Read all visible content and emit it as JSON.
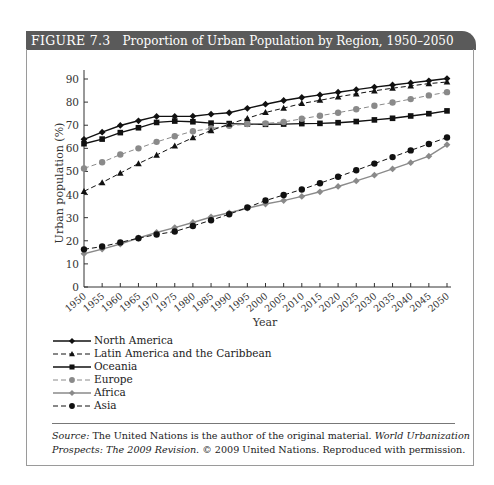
{
  "figure": {
    "number": "FIGURE 7.3",
    "title": "Proportion of Urban Population by Region, 1950–2050"
  },
  "colors": {
    "title_bar": "#5a5a5a",
    "black": "#111111",
    "gray": "#8a8a8a"
  },
  "source": {
    "label": "Source:",
    "text1": " The United Nations is the author of the original material. ",
    "work": "World Urbanization Prospects: The 2009 Revision.",
    "text2": " © 2009 United Nations. Reproduced with permission."
  },
  "chart_data": {
    "type": "line",
    "title": "Proportion of Urban Population by Region, 1950–2050",
    "xlabel": "Year",
    "ylabel": "Urban population (%)",
    "ylim": [
      0,
      90
    ],
    "yticks": [
      0,
      10,
      20,
      30,
      40,
      50,
      60,
      70,
      80,
      90
    ],
    "grid": false,
    "legend_position": "below",
    "x": [
      1950,
      1955,
      1960,
      1965,
      1970,
      1975,
      1980,
      1985,
      1990,
      1995,
      2000,
      2005,
      2010,
      2015,
      2020,
      2025,
      2030,
      2035,
      2040,
      2045,
      2050
    ],
    "series": [
      {
        "name": "North America",
        "marker": "diamond",
        "line": "solid",
        "color": "#111111",
        "values": [
          63.9,
          67.0,
          69.9,
          71.9,
          73.8,
          73.8,
          73.9,
          74.8,
          75.4,
          77.3,
          79.1,
          80.7,
          82.0,
          83.1,
          84.3,
          85.4,
          86.5,
          87.4,
          88.3,
          89.2,
          90.2
        ]
      },
      {
        "name": "Latin America and the Caribbean",
        "marker": "triangle",
        "line": "dashed",
        "color": "#111111",
        "values": [
          41.4,
          45.2,
          49.3,
          53.4,
          57.1,
          61.0,
          64.6,
          67.7,
          70.5,
          73.0,
          75.5,
          77.4,
          79.4,
          80.8,
          82.3,
          83.6,
          84.9,
          86.0,
          87.0,
          88.0,
          88.7
        ]
      },
      {
        "name": "Oceania",
        "marker": "square",
        "line": "solid",
        "color": "#111111",
        "values": [
          62.0,
          64.0,
          66.8,
          68.9,
          71.2,
          71.8,
          71.5,
          70.9,
          70.7,
          70.5,
          70.4,
          70.5,
          70.7,
          70.8,
          71.1,
          71.6,
          72.3,
          73.0,
          74.0,
          75.0,
          76.2
        ]
      },
      {
        "name": "Europe",
        "marker": "circle",
        "line": "dashed",
        "color": "#8a8a8a",
        "values": [
          51.3,
          54.0,
          57.3,
          60.0,
          62.8,
          65.2,
          67.4,
          68.6,
          69.8,
          70.5,
          70.8,
          71.4,
          72.8,
          74.1,
          75.4,
          76.9,
          78.4,
          79.8,
          81.3,
          82.9,
          84.3
        ]
      },
      {
        "name": "Africa",
        "marker": "diamond",
        "line": "solid",
        "color": "#8a8a8a",
        "values": [
          14.4,
          16.4,
          18.6,
          21.2,
          23.6,
          25.7,
          27.9,
          30.3,
          32.1,
          34.1,
          35.9,
          37.4,
          39.2,
          41.2,
          43.5,
          45.9,
          48.4,
          51.1,
          53.8,
          56.6,
          61.6
        ]
      },
      {
        "name": "Asia",
        "marker": "circle",
        "line": "dashed",
        "color": "#111111",
        "values": [
          16.3,
          17.5,
          19.3,
          21.1,
          22.7,
          24.0,
          26.4,
          28.9,
          31.5,
          34.4,
          37.4,
          39.8,
          42.2,
          44.9,
          47.7,
          50.5,
          53.4,
          56.2,
          59.1,
          61.9,
          64.7
        ]
      }
    ]
  }
}
